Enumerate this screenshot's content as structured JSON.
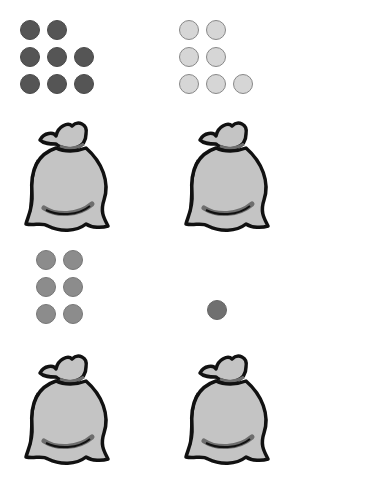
{
  "panels": [
    {
      "id": "top-left",
      "count": 8,
      "dot_color": "#555555",
      "dot_border": "#4a4a4a",
      "dots": [
        [
          22,
          22
        ],
        [
          49,
          22
        ],
        [
          22,
          49
        ],
        [
          49,
          49
        ],
        [
          76,
          49
        ],
        [
          22,
          76
        ],
        [
          49,
          76
        ],
        [
          76,
          76
        ]
      ]
    },
    {
      "id": "top-right",
      "count": 7,
      "dot_color": "#d6d6d6",
      "dot_border": "#888888",
      "dots": [
        [
          181,
          22
        ],
        [
          208,
          22
        ],
        [
          181,
          49
        ],
        [
          208,
          49
        ],
        [
          181,
          76
        ],
        [
          208,
          76
        ],
        [
          235,
          76
        ]
      ]
    },
    {
      "id": "bottom-left",
      "count": 6,
      "dot_color": "#8c8c8c",
      "dot_border": "#777777",
      "dots": [
        [
          38,
          252
        ],
        [
          65,
          252
        ],
        [
          38,
          279
        ],
        [
          65,
          279
        ],
        [
          38,
          306
        ],
        [
          65,
          306
        ]
      ]
    },
    {
      "id": "bottom-right",
      "count": 1,
      "dot_color": "#707070",
      "dot_border": "#666666",
      "dots": [
        [
          209,
          302
        ]
      ]
    }
  ],
  "bags": [
    {
      "id": "bag-top-left",
      "x": 20,
      "y": 112
    },
    {
      "id": "bag-top-right",
      "x": 180,
      "y": 112
    },
    {
      "id": "bag-bottom-left",
      "x": 20,
      "y": 345
    },
    {
      "id": "bag-bottom-right",
      "x": 180,
      "y": 345
    }
  ],
  "colors": {
    "bag_fill": "#c4c4c4",
    "bag_outline": "#111111",
    "bag_shadow": "#6e6e6e"
  }
}
